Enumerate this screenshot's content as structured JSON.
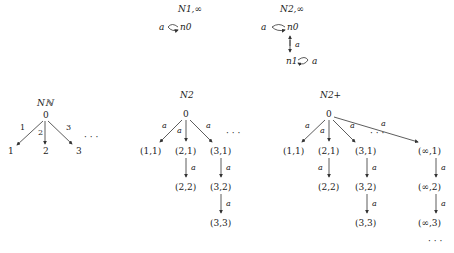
{
  "graphs": {
    "n1inf": {
      "title": "N1,∞",
      "label": "a",
      "node": "n0"
    },
    "n2inf": {
      "title": "N2,∞",
      "n0": "n0",
      "n1": "n1",
      "loop0": "a",
      "loop1": "a",
      "edge": "a"
    },
    "nN": {
      "title": "Nℕ",
      "root": "0",
      "children": [
        "1",
        "2",
        "3"
      ],
      "edge_labels": [
        "1",
        "2",
        "3"
      ],
      "ellipsis": "· · ·"
    },
    "n2": {
      "title": "N2",
      "root": "0",
      "edge": "a",
      "col1": [
        "(1,1)"
      ],
      "col2": [
        "(2,1)",
        "(2,2)"
      ],
      "col3": [
        "(3,1)",
        "(3,2)",
        "(3,3)"
      ],
      "ellipsis": "· · ·"
    },
    "n2plus": {
      "title": "N2+",
      "root": "0",
      "edge": "a",
      "col1": [
        "(1,1)"
      ],
      "col2": [
        "(2,1)",
        "(2,2)"
      ],
      "col3": [
        "(3,1)",
        "(3,2)",
        "(3,3)"
      ],
      "colinf": [
        "(∞,1)",
        "(∞,2)",
        "(∞,3)"
      ],
      "ellipsis": "· · ·"
    }
  }
}
